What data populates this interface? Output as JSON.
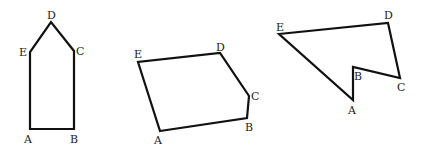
{
  "diagram": {
    "background": "#ffffff",
    "stroke_color": "#111111",
    "polygons": [
      {
        "id": "pentagon-house",
        "points": "30,129 74,129 74,51 51,22 30,52",
        "labels": [
          {
            "text": "A",
            "x": 24,
            "y": 143
          },
          {
            "text": "B",
            "x": 70,
            "y": 143
          },
          {
            "text": "C",
            "x": 76,
            "y": 55
          },
          {
            "text": "D",
            "x": 47,
            "y": 19
          },
          {
            "text": "E",
            "x": 19,
            "y": 56
          }
        ]
      },
      {
        "id": "pentagon-convex",
        "points": "160,131 247,118 249,96 220,53 138,62",
        "labels": [
          {
            "text": "A",
            "x": 154,
            "y": 144
          },
          {
            "text": "B",
            "x": 245,
            "y": 131
          },
          {
            "text": "C",
            "x": 251,
            "y": 100
          },
          {
            "text": "D",
            "x": 216,
            "y": 51
          },
          {
            "text": "E",
            "x": 134,
            "y": 58
          }
        ]
      },
      {
        "id": "pentagon-concave",
        "points": "353,100 353,67 400,78 388,23 279,34",
        "labels": [
          {
            "text": "A",
            "x": 348,
            "y": 114
          },
          {
            "text": "B",
            "x": 354,
            "y": 80
          },
          {
            "text": "C",
            "x": 397,
            "y": 91
          },
          {
            "text": "D",
            "x": 384,
            "y": 19
          },
          {
            "text": "E",
            "x": 276,
            "y": 31
          }
        ]
      }
    ]
  }
}
